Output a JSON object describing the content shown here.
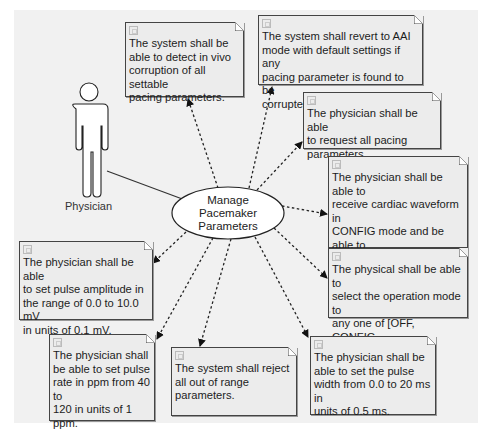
{
  "diagram": {
    "type": "use-case",
    "actor": {
      "name": "Physician",
      "icon": "stick-figure-actor-icon"
    },
    "use_case": {
      "label": "Manage\nPacemaker\nParameters"
    },
    "association": {
      "from": "Physician",
      "to": "Manage Pacemaker Parameters",
      "style": "solid"
    },
    "requirements": [
      {
        "id": "detect-corruption",
        "text": "The system shall be\nable to detect in vivo\ncorruption of all settable\npacing parameters."
      },
      {
        "id": "revert-aai",
        "text": "The system shall revert to AAI\nmode with default settings if any\npacing parameter is found to be\ncorrupted."
      },
      {
        "id": "request-parameters",
        "text": "The physician shall be able\nto request all pacing\nparameters."
      },
      {
        "id": "cardiac-waveform",
        "text": "The physician shall be able to\nreceive cardiac waveform in\nCONFIG mode and be able to\nstimulate the heart pulse on\ncommand."
      },
      {
        "id": "operation-mode",
        "text": "The physical shall be able to\nselect the operation mode to\nany one of [OFF, CONFIG,\nAAI, VVI, AAT, VVT]"
      },
      {
        "id": "pulse-width",
        "text": "The physician shall be\nable to set the pulse\nwidth from 0.0 to 20 ms in\nunits of 0.5 ms."
      },
      {
        "id": "reject-out-of-range",
        "text": "The system shall reject\nall out of range\nparameters."
      },
      {
        "id": "pulse-rate",
        "text": "The physician shall\nbe able to set pulse\nrate in ppm from 40 to\n120 in units of 1 ppm."
      },
      {
        "id": "pulse-amplitude",
        "text": "The physician shall be able\nto set pulse amplitude in\nthe range of 0.0 to 10.0 mV\nin units of 0.1 mV."
      }
    ],
    "requirement_icon": "requirement-icon",
    "dependency_style": "dashed-arrow"
  }
}
